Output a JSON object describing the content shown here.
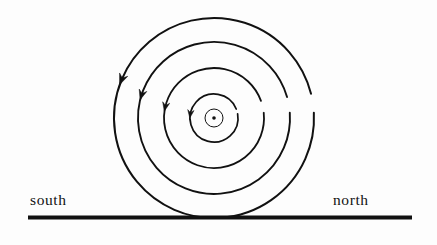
{
  "figure": {
    "type": "physics-field-diagram",
    "background_color": "#fdfdfd",
    "ink_color": "#111111"
  },
  "labels": {
    "left": "south",
    "right": "north"
  },
  "ground_line": {
    "name": "ground-line",
    "x1": 28,
    "y1": 217.5,
    "x2": 412,
    "y2": 217.5,
    "thickness": 4,
    "color": "#111111"
  },
  "center_symbol": {
    "name": "current-out-of-page-symbol",
    "cx": 214,
    "cy": 118,
    "radius": 9,
    "dot_radius": 1.8,
    "stroke_width": 1,
    "color": "#111111"
  },
  "field_lines": [
    {
      "name": "field-line-1",
      "cx": 214,
      "cy": 118,
      "radius": 24,
      "stroke_width": 1.7,
      "gap_start_deg": 10,
      "gap_end_deg": 22,
      "arrow_deg": 172,
      "arrow_size": 8
    },
    {
      "name": "field-line-2",
      "cx": 214,
      "cy": 118,
      "radius": 50,
      "stroke_width": 1.8,
      "gap_start_deg": 6,
      "gap_end_deg": 20,
      "arrow_deg": 168,
      "arrow_size": 9
    },
    {
      "name": "field-line-3",
      "cx": 214,
      "cy": 118,
      "radius": 76,
      "stroke_width": 1.9,
      "gap_start_deg": 4,
      "gap_end_deg": 16,
      "arrow_deg": 163,
      "arrow_size": 10
    },
    {
      "name": "field-line-4",
      "cx": 214,
      "cy": 118,
      "radius": 100,
      "stroke_width": 2.0,
      "gap_start_deg": 3,
      "gap_end_deg": 14,
      "arrow_deg": 158,
      "arrow_size": 11
    }
  ],
  "rotation_sense": "counterclockwise",
  "arrow_color": "#111111"
}
